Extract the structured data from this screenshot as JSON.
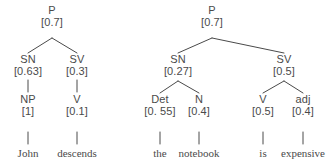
{
  "figure": {
    "kind": "probabilistic-parse-trees",
    "text_color": "#4a4a4a",
    "background_color": "#ffffff",
    "tree_count": 2
  },
  "trees": [
    {
      "id": "left-tree",
      "sentence": "John descends",
      "root": {
        "label": "P",
        "prob": "[0.7]"
      },
      "level2": [
        {
          "label": "SN",
          "prob": "[0.63]"
        },
        {
          "label": "SV",
          "prob": "[0.3]"
        }
      ],
      "level3": [
        {
          "label": "NP",
          "prob": "[1]"
        },
        {
          "label": "V",
          "prob": "[0.1]"
        }
      ],
      "leaves": [
        {
          "word": "John"
        },
        {
          "word": "descends"
        }
      ]
    },
    {
      "id": "right-tree",
      "sentence": "the notebook is expensive",
      "root": {
        "label": "P",
        "prob": "[0.7]"
      },
      "level2": [
        {
          "label": "SN",
          "prob": "[0.27]"
        },
        {
          "label": "SV",
          "prob": "[0.5]"
        }
      ],
      "level3": [
        {
          "label": "Det",
          "prob": "[0. 55]"
        },
        {
          "label": "N",
          "prob": "[0.4]"
        },
        {
          "label": "V",
          "prob": "[0.5]"
        },
        {
          "label": "adj",
          "prob": "[0.4]"
        }
      ],
      "leaves": [
        {
          "word": "the"
        },
        {
          "word": "notebook"
        },
        {
          "word": "is"
        },
        {
          "word": "expensive"
        }
      ]
    }
  ]
}
